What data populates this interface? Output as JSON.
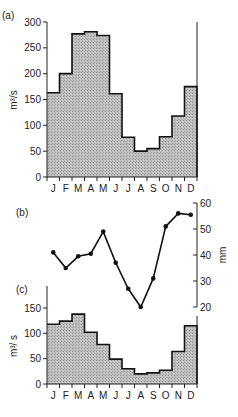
{
  "chart_data": [
    {
      "panel": "(a)",
      "type": "bar",
      "style": "step-histogram",
      "categories": [
        "J",
        "F",
        "M",
        "A",
        "M",
        "J",
        "J",
        "A",
        "S",
        "O",
        "N",
        "D"
      ],
      "values": [
        163,
        200,
        277,
        281,
        274,
        161,
        77,
        50,
        55,
        78,
        118,
        175
      ],
      "ylabel": "m³/s",
      "yticks": [
        0,
        50,
        100,
        150,
        200,
        250,
        300
      ],
      "ylim": [
        0,
        300
      ],
      "axis_side": "left"
    },
    {
      "panel": "(b)",
      "type": "line",
      "categories": [
        "J",
        "F",
        "M",
        "A",
        "M",
        "J",
        "J",
        "A",
        "S",
        "O",
        "N",
        "D"
      ],
      "values": [
        41,
        35,
        39.5,
        40.5,
        49,
        37,
        27,
        20,
        31,
        51,
        56,
        55.5
      ],
      "ylabel": "mm",
      "yticks": [
        20,
        30,
        40,
        50,
        60
      ],
      "ylim": [
        20,
        60
      ],
      "axis_side": "right",
      "markers": true
    },
    {
      "panel": "(c)",
      "type": "bar",
      "style": "step-histogram",
      "categories": [
        "J",
        "F",
        "M",
        "A",
        "M",
        "J",
        "J",
        "A",
        "S",
        "O",
        "N",
        "D"
      ],
      "values": [
        118,
        124,
        138,
        102,
        78,
        49,
        30,
        20,
        22,
        27,
        64,
        115
      ],
      "ylabel": "m³/s",
      "yticks": [
        0,
        50,
        100,
        150
      ],
      "ylim": [
        0,
        150
      ],
      "axis_side": "left"
    }
  ],
  "labels": {
    "panel_a": "(a)",
    "panel_b": "(b)",
    "panel_c": "(c)",
    "ylabel_a": "m³/s",
    "ylabel_b": "mm",
    "ylabel_c": "m³/ s"
  }
}
